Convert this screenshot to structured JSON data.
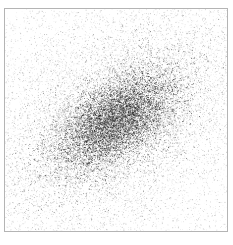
{
  "figure": {
    "width": 233,
    "height": 245,
    "background_color": "#ffffff"
  },
  "plot_frame": {
    "x": 4,
    "y": 8,
    "width": 224,
    "height": 224,
    "border_color": "#b4b4b4",
    "border_width": 1,
    "fill_color": "#ffffff"
  },
  "chart_data": {
    "type": "scatter",
    "title": "",
    "subtitle": "",
    "xlabel": "",
    "ylabel": "",
    "xlim": [
      0,
      224
    ],
    "ylim": [
      0,
      224
    ],
    "grid": false,
    "legend": null,
    "legend_position": "none",
    "tick_labels_x": [],
    "tick_labels_y": [],
    "annotations": [],
    "point_color": "#1a1a1a",
    "point_size": 1,
    "point_alpha": 0.55,
    "n_points": 26000,
    "components": [
      {
        "name": "core-cluster",
        "kind": "gaussian",
        "n": 9000,
        "center_x": 112,
        "center_y": 112,
        "sigma_major": 34,
        "sigma_minor": 18,
        "angle_deg": -35,
        "darkness": 0.85
      },
      {
        "name": "inner-halo",
        "kind": "gaussian",
        "n": 7000,
        "center_x": 110,
        "center_y": 112,
        "sigma_major": 58,
        "sigma_minor": 34,
        "angle_deg": -35,
        "darkness": 0.5
      },
      {
        "name": "outer-halo",
        "kind": "gaussian",
        "n": 5500,
        "center_x": 108,
        "center_y": 114,
        "sigma_major": 92,
        "sigma_minor": 62,
        "angle_deg": -33,
        "darkness": 0.32
      },
      {
        "name": "background-noise",
        "kind": "uniform",
        "n": 4500,
        "darkness": 0.22
      }
    ]
  }
}
